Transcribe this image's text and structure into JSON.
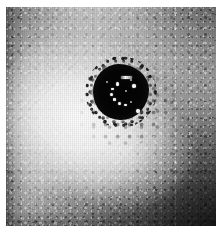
{
  "image": {
    "kind": "grayscale-halftone-astronomical-image",
    "alt_description": "Noisy grayscale halftone image of a dark circular core with bright speckles arranged in a ring, surrounded by a bright diffuse halo fading to dark at the corners",
    "colorspace": "grayscale",
    "width": 224,
    "height": 234,
    "plate": {
      "left": 6,
      "top": 7,
      "width": 210,
      "height": 219
    },
    "page_background": "#ffffff",
    "tones": {
      "paper_white": "#ffffff",
      "halo_bright": "#fcfcfc",
      "mid_gray": "#bdbdbd",
      "shadow_gray": "#4a4a4a",
      "core_black": "#030303",
      "speckle_white": "#fdfdfd"
    },
    "features": {
      "core": {
        "label": "dark central core",
        "center_x": 121,
        "center_y": 92,
        "radius": 28
      },
      "halo": {
        "label": "bright diffuse halo",
        "center_x": 78,
        "center_y": 117
      },
      "vignette": {
        "label": "dark corner falloff",
        "darkest_corner": "bottom-right"
      }
    },
    "core_speckles": [
      {
        "x": 50,
        "y": 22,
        "w": 11,
        "h": 2.2,
        "shape": "dash"
      },
      {
        "x": 41,
        "y": 33,
        "w": 3.4,
        "h": 3.4,
        "shape": "dot"
      },
      {
        "x": 33,
        "y": 42,
        "w": 2.8,
        "h": 2.8,
        "shape": "dot"
      },
      {
        "x": 31,
        "y": 52,
        "w": 3.0,
        "h": 3.0,
        "shape": "dot"
      },
      {
        "x": 36,
        "y": 61,
        "w": 2.6,
        "h": 2.6,
        "shape": "dot"
      },
      {
        "x": 45,
        "y": 68,
        "w": 3.2,
        "h": 3.2,
        "shape": "dot"
      },
      {
        "x": 56,
        "y": 71,
        "w": 2.4,
        "h": 2.4,
        "shape": "dot"
      },
      {
        "x": 66,
        "y": 66,
        "w": 2.2,
        "h": 2.2,
        "shape": "dim"
      },
      {
        "x": 70,
        "y": 36,
        "w": 3.6,
        "h": 3.6,
        "shape": "dot"
      },
      {
        "x": 66,
        "y": 26,
        "w": 2.4,
        "h": 2.4,
        "shape": "dim"
      },
      {
        "x": 58,
        "y": 47,
        "w": 2.0,
        "h": 2.0,
        "shape": "dim"
      },
      {
        "x": 76,
        "y": 80,
        "w": 4.0,
        "h": 4.0,
        "shape": "dot"
      },
      {
        "x": 24,
        "y": 30,
        "w": 2.0,
        "h": 2.0,
        "shape": "dim"
      }
    ]
  }
}
